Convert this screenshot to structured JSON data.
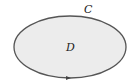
{
  "diagram": {
    "region_label": "D",
    "curve_label": "C",
    "fill_color": "#ececec",
    "stroke_color": "#555555",
    "orientation": "counterclockwise arrow at bottom"
  }
}
